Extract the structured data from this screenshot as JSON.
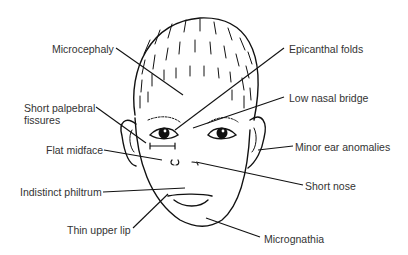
{
  "diagram": {
    "line_color": "#111111",
    "text_color": "#333333",
    "labels": [
      {
        "id": "microcephaly",
        "text": "Microcephaly",
        "x": 52,
        "y": 43
      },
      {
        "id": "epicanthal-folds",
        "text": "Epicanthal folds",
        "x": 289,
        "y": 43
      },
      {
        "id": "short-palpebral-fissures",
        "text": "Short palpebral\nfissures",
        "line1": "Short palpebral",
        "line2": "fissures",
        "x": 24,
        "y": 102
      },
      {
        "id": "low-nasal-bridge",
        "text": "Low nasal bridge",
        "x": 289,
        "y": 92
      },
      {
        "id": "flat-midface",
        "text": "Flat midface",
        "x": 46,
        "y": 144
      },
      {
        "id": "minor-ear-anomalies",
        "text": "Minor ear anomalies",
        "x": 295,
        "y": 141
      },
      {
        "id": "indistinct-philtrum",
        "text": "Indistinct philtrum",
        "x": 20,
        "y": 186
      },
      {
        "id": "short-nose",
        "text": "Short nose",
        "x": 305,
        "y": 180
      },
      {
        "id": "thin-upper-lip",
        "text": "Thin upper lip",
        "x": 67,
        "y": 224
      },
      {
        "id": "micrognathia",
        "text": "Micrognathia",
        "x": 264,
        "y": 233
      }
    ]
  }
}
